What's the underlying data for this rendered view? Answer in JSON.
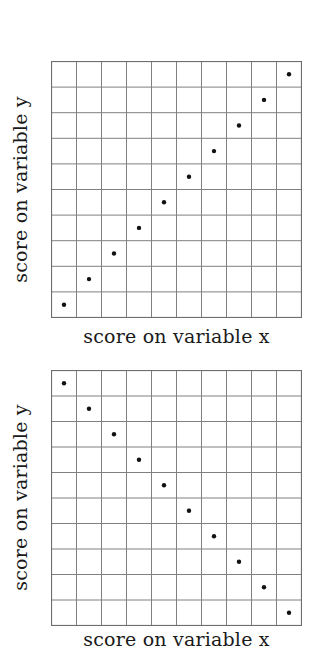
{
  "chart_data": [
    {
      "type": "scatter",
      "title": "",
      "xlabel": "score on variable x",
      "ylabel": "score on variable y",
      "grid": true,
      "grid_divisions": {
        "x": 10,
        "y": 10
      },
      "xlim": [
        0,
        10
      ],
      "ylim": [
        0,
        10
      ],
      "x": [
        0.5,
        1.5,
        2.5,
        3.5,
        4.5,
        5.5,
        6.5,
        7.5,
        8.5,
        9.5
      ],
      "y": [
        0.5,
        1.5,
        2.5,
        3.5,
        4.5,
        5.5,
        6.5,
        7.5,
        8.5,
        9.5
      ],
      "relationship": "perfect positive correlation"
    },
    {
      "type": "scatter",
      "title": "",
      "xlabel": "score on variable x",
      "ylabel": "score on variable y",
      "grid": true,
      "grid_divisions": {
        "x": 10,
        "y": 10
      },
      "xlim": [
        0,
        10
      ],
      "ylim": [
        0,
        10
      ],
      "x": [
        0.5,
        1.5,
        2.5,
        3.5,
        4.5,
        5.5,
        6.5,
        7.5,
        8.5,
        9.5
      ],
      "y": [
        9.5,
        8.5,
        7.5,
        6.5,
        5.5,
        4.5,
        3.5,
        2.5,
        1.5,
        0.5
      ],
      "relationship": "perfect negative correlation"
    }
  ],
  "charts": [
    {
      "xlabel": "score on variable x",
      "ylabel": "score on variable y"
    },
    {
      "xlabel": "score on variable x",
      "ylabel": "score on variable y"
    }
  ],
  "colors": {
    "grid": "#808080",
    "border": "#6e6e6e",
    "point": "#111111",
    "text": "#1a1a1a",
    "background": "#ffffff"
  }
}
